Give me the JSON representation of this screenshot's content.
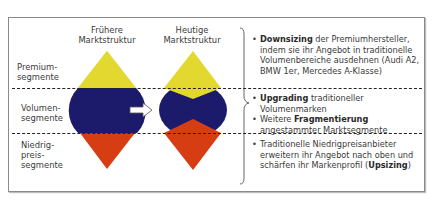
{
  "columns": {
    "before": "Frühere Marktstruktur",
    "before_l1": "Frühere",
    "before_l2": "Marktstruktur",
    "after_l1": "Heutige",
    "after_l2": "Marktstruktur"
  },
  "segments": {
    "premium_l1": "Premium-",
    "premium_l2": "segmente",
    "volume_l1": "Volumen-",
    "volume_l2": "segmente",
    "low_l1": "Niedrig-",
    "low_l2": "preis-",
    "low_l3": "segmente"
  },
  "colors": {
    "premium": "#e3d82f",
    "volume": "#1c1a6b",
    "low": "#d63d13"
  },
  "bullets": {
    "b1_bold": "Downsizing",
    "b1_text": " der Premiumhersteller, indem sie ihr Angebot in traditionelle Volumenbereiche ausdehnen (Audi A2, BMW 1er, Mercedes A-Klasse)",
    "b2_bold": "Upgrading",
    "b2_text": " traditioneller Volumenmarken",
    "b3_pre": "Weitere ",
    "b3_bold": "Fragmentierung",
    "b3_text": " angestammter Marktsegmente",
    "b4_text": "Traditionelle Niedrigpreisanbieter erweitern ihr Angebot nach oben und schärfen ihr Markenprofil (",
    "b4_bold": "Upsizing",
    "b4_end": ")"
  }
}
